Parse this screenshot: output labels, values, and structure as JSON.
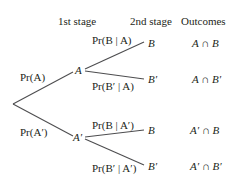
{
  "headers": {
    "stage1": "1st stage",
    "stage2": "2nd stage",
    "outcomes": "Outcomes"
  },
  "nodes": {
    "A": "A",
    "A_prime": "A′",
    "B_top": "B",
    "Bp_top": "B′",
    "B_bottom": "B",
    "Bp_bottom": "B′"
  },
  "branch_labels": {
    "pr_A": "Pr(A)",
    "pr_Ap": "Pr(A′)",
    "pr_B_given_A": "Pr(B | A)",
    "pr_Bp_given_A": "Pr(B′ | A)",
    "pr_B_given_Ap": "Pr(B | A′)",
    "pr_Bp_given_Ap": "Pr(B′ | A′)"
  },
  "outcomes": [
    "A ∩ B",
    "A ∩ B′",
    "A′ ∩ B",
    "A′ ∩ B′"
  ],
  "colors": {
    "line": "#4d4d4f",
    "text": "#231f20"
  }
}
